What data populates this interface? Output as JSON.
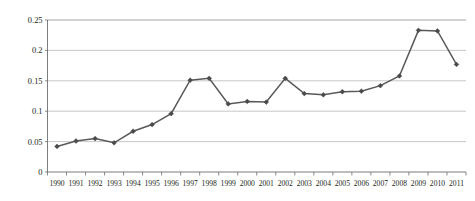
{
  "chart_data": {
    "type": "line",
    "title": "",
    "subtitle": "",
    "xlabel": "",
    "ylabel": "",
    "grid": true,
    "legend": false,
    "legend_position": "none",
    "marker": "diamond",
    "series_color": "#595959",
    "marker_color": "#4a4a4a",
    "gridline_color": "#b9b9b9",
    "axis_color": "#6d6d6d",
    "categories": [
      "1990",
      "1991",
      "1992",
      "1993",
      "1994",
      "1995",
      "1996",
      "1997",
      "1998",
      "1999",
      "2000",
      "2001",
      "2002",
      "2003",
      "2004",
      "2005",
      "2006",
      "2007",
      "2008",
      "2009",
      "2010",
      "2011"
    ],
    "values": [
      0.042,
      0.051,
      0.055,
      0.048,
      0.067,
      0.078,
      0.096,
      0.151,
      0.154,
      0.112,
      0.116,
      0.115,
      0.154,
      0.129,
      0.127,
      0.132,
      0.133,
      0.142,
      0.158,
      0.233,
      0.232,
      0.177
    ],
    "ylim": [
      0,
      0.25
    ],
    "yticks": [
      0,
      0.05,
      0.1,
      0.15,
      0.2,
      0.25
    ],
    "ytick_labels": [
      "0",
      "0.05",
      "0.1",
      "0.15",
      "0.2",
      "0.25"
    ],
    "xtick_labels": [
      "1990",
      "1991",
      "1992",
      "1993",
      "1994",
      "1995",
      "1996",
      "1997",
      "1998",
      "1999",
      "2000",
      "2001",
      "2002",
      "2003",
      "2004",
      "2005",
      "2006",
      "2007",
      "2008",
      "2009",
      "2010",
      "2011"
    ]
  }
}
